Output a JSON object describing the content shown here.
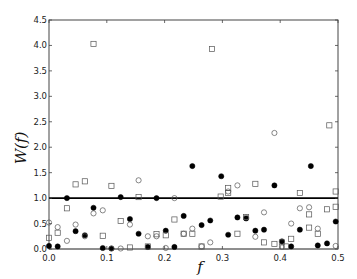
{
  "chart_data": {
    "type": "scatter",
    "title": "",
    "xlabel": "f",
    "ylabel": "W(f)",
    "xlim": [
      0.0,
      0.5
    ],
    "ylim": [
      0.0,
      4.5
    ],
    "xticks": [
      "0.0",
      "0.1",
      "0.2",
      "0.3",
      "0.4",
      "0.5"
    ],
    "yticks": [
      "0.0",
      "0.5",
      "1.0",
      "1.5",
      "2.0",
      "2.5",
      "3.0",
      "3.5",
      "4.0",
      "4.5"
    ],
    "grid": false,
    "legend": null,
    "reference_line": {
      "y": 1.0,
      "color": "#000000"
    },
    "series": [
      {
        "name": "filled circles",
        "marker": "filled-circle",
        "color": "#000000",
        "points": [
          [
            0.0,
            0.06
          ],
          [
            0.015,
            0.05
          ],
          [
            0.031,
            1.0
          ],
          [
            0.046,
            0.35
          ],
          [
            0.062,
            0.27
          ],
          [
            0.077,
            0.81
          ],
          [
            0.093,
            0.02
          ],
          [
            0.108,
            0.01
          ],
          [
            0.124,
            1.02
          ],
          [
            0.14,
            0.59
          ],
          [
            0.155,
            0.3
          ],
          [
            0.171,
            0.04
          ],
          [
            0.186,
            1.0
          ],
          [
            0.202,
            0.36
          ],
          [
            0.217,
            0.04
          ],
          [
            0.233,
            0.65
          ],
          [
            0.248,
            1.63
          ],
          [
            0.264,
            0.47
          ],
          [
            0.279,
            0.56
          ],
          [
            0.298,
            1.43
          ],
          [
            0.31,
            0.28
          ],
          [
            0.326,
            0.62
          ],
          [
            0.341,
            0.6
          ],
          [
            0.357,
            0.36
          ],
          [
            0.372,
            0.38
          ],
          [
            0.39,
            1.25
          ],
          [
            0.403,
            0.15
          ],
          [
            0.419,
            0.05
          ],
          [
            0.434,
            0.38
          ],
          [
            0.453,
            1.63
          ],
          [
            0.465,
            0.07
          ],
          [
            0.481,
            0.11
          ],
          [
            0.496,
            0.54
          ]
        ]
      },
      {
        "name": "open circles",
        "marker": "open-circle",
        "color": "#555555",
        "points": [
          [
            0.0,
            0.52
          ],
          [
            0.015,
            0.43
          ],
          [
            0.031,
            0.16
          ],
          [
            0.046,
            0.48
          ],
          [
            0.062,
            0.25
          ],
          [
            0.077,
            0.7
          ],
          [
            0.093,
            0.76
          ],
          [
            0.108,
            0.01
          ],
          [
            0.124,
            0.01
          ],
          [
            0.14,
            0.48
          ],
          [
            0.155,
            1.35
          ],
          [
            0.171,
            0.25
          ],
          [
            0.186,
            0.25
          ],
          [
            0.202,
            0.02
          ],
          [
            0.217,
            1.0
          ],
          [
            0.233,
            0.3
          ],
          [
            0.248,
            0.4
          ],
          [
            0.264,
            0.05
          ],
          [
            0.279,
            0.13
          ],
          [
            0.31,
            1.13
          ],
          [
            0.326,
            1.25
          ],
          [
            0.341,
            0.62
          ],
          [
            0.357,
            0.24
          ],
          [
            0.372,
            0.72
          ],
          [
            0.39,
            2.28
          ],
          [
            0.403,
            0.04
          ],
          [
            0.419,
            0.5
          ],
          [
            0.434,
            0.8
          ],
          [
            0.45,
            0.82
          ],
          [
            0.465,
            0.4
          ],
          [
            0.496,
            0.06
          ]
        ]
      },
      {
        "name": "open squares",
        "marker": "open-square",
        "color": "#555555",
        "points": [
          [
            0.0,
            0.22
          ],
          [
            0.015,
            0.32
          ],
          [
            0.031,
            0.8
          ],
          [
            0.046,
            1.27
          ],
          [
            0.062,
            1.33
          ],
          [
            0.077,
            4.03
          ],
          [
            0.093,
            0.26
          ],
          [
            0.108,
            1.24
          ],
          [
            0.124,
            0.55
          ],
          [
            0.14,
            0.03
          ],
          [
            0.155,
            1.02
          ],
          [
            0.171,
            0.05
          ],
          [
            0.186,
            0.29
          ],
          [
            0.202,
            0.27
          ],
          [
            0.217,
            0.58
          ],
          [
            0.233,
            0.3
          ],
          [
            0.248,
            0.3
          ],
          [
            0.264,
            0.05
          ],
          [
            0.282,
            3.93
          ],
          [
            0.297,
            1.03
          ],
          [
            0.31,
            1.1
          ],
          [
            0.31,
            1.2
          ],
          [
            0.326,
            0.3
          ],
          [
            0.341,
            0.63
          ],
          [
            0.357,
            1.28
          ],
          [
            0.372,
            0.13
          ],
          [
            0.39,
            0.1
          ],
          [
            0.403,
            0.13
          ],
          [
            0.41,
            0.05
          ],
          [
            0.419,
            0.2
          ],
          [
            0.434,
            1.1
          ],
          [
            0.45,
            0.68
          ],
          [
            0.45,
            0.42
          ],
          [
            0.465,
            0.3
          ],
          [
            0.481,
            0.78
          ],
          [
            0.485,
            2.43
          ],
          [
            0.496,
            1.13
          ],
          [
            0.496,
            0.83
          ]
        ]
      }
    ]
  }
}
